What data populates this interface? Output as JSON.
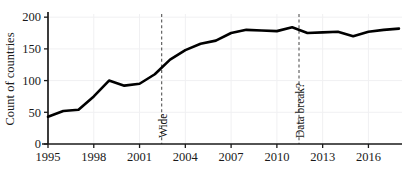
{
  "chart_data": {
    "type": "line",
    "title": "",
    "xlabel": "",
    "ylabel": "Count of countries",
    "xlim": [
      1995,
      2018.2
    ],
    "ylim": [
      0,
      205
    ],
    "grid": true,
    "legend_position": "none",
    "x": [
      1995,
      1996,
      1997,
      1998,
      1999,
      2000,
      2001,
      2002,
      2003,
      2004,
      2005,
      2006,
      2007,
      2008,
      2009,
      2010,
      2011,
      2012,
      2013,
      2014,
      2015,
      2016,
      2017,
      2018
    ],
    "values": [
      43,
      52,
      54,
      75,
      100,
      92,
      95,
      110,
      133,
      148,
      158,
      163,
      175,
      180,
      179,
      178,
      184,
      175,
      176,
      177,
      170,
      177,
      180,
      182
    ],
    "series": [
      {
        "name": "Count of countries",
        "color": "#000000",
        "values": [
          43,
          52,
          54,
          75,
          100,
          92,
          95,
          110,
          133,
          148,
          158,
          163,
          175,
          180,
          179,
          178,
          184,
          175,
          176,
          177,
          170,
          177,
          180,
          182
        ]
      }
    ],
    "xticks": [
      1995,
      1998,
      2001,
      2004,
      2007,
      2010,
      2013,
      2016
    ],
    "xticklabels": [
      "1995",
      "1998",
      "2001",
      "2004",
      "2007",
      "2010",
      "2013",
      "2016"
    ],
    "yticks": [
      0,
      50,
      100,
      150,
      200
    ],
    "yticklabels": [
      "0",
      "50",
      "100",
      "150",
      "200"
    ],
    "annotations": [
      {
        "label": "Wide",
        "x": 2002.45,
        "style": "vertical-dashed-line",
        "rotation": -90
      },
      {
        "label": "Data break?",
        "x": 2011.45,
        "style": "vertical-dashed-line",
        "rotation": -90
      }
    ],
    "colors": {
      "line": "#000000",
      "axis": "#1a1a1a",
      "grid": "#f0f0f2",
      "annotation_line": "#555555",
      "background": "#ffffff"
    }
  }
}
